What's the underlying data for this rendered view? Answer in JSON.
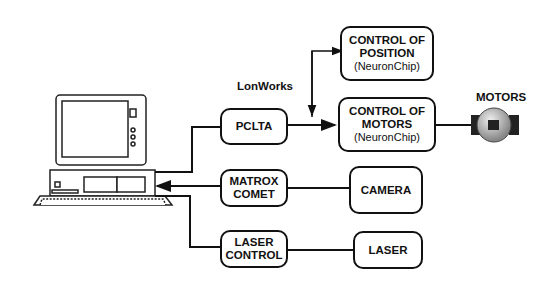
{
  "diagram": {
    "network_label": "LonWorks",
    "motors_label": "MOTORS",
    "nodes": {
      "pclta": {
        "lines": [
          "PCLTA"
        ]
      },
      "control_position": {
        "lines": [
          "CONTROL OF",
          "POSITION",
          "(NeuronChip)"
        ]
      },
      "control_motors": {
        "lines": [
          "CONTROL OF",
          "MOTORS",
          "(NeuronChip)"
        ]
      },
      "matrox": {
        "lines": [
          "MATROX",
          "COMET"
        ]
      },
      "camera": {
        "lines": [
          "CAMERA"
        ]
      },
      "laser_control": {
        "lines": [
          "LASER",
          "CONTROL"
        ]
      },
      "laser": {
        "lines": [
          "LASER"
        ]
      }
    },
    "icons": [
      "computer-icon",
      "motor-icon"
    ]
  }
}
